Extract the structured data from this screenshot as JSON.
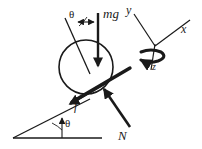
{
  "diagram": {
    "type": "free-body-diagram",
    "stroke_color": "#1a1a1a",
    "background_color": "#ffffff",
    "labels": {
      "weight": "mg",
      "friction": "f",
      "normal": "N",
      "incline_angle": "θ",
      "slope_angle": "θ",
      "axis_x": "x",
      "axis_y": "y",
      "axis_z": "z"
    },
    "elements": {
      "ball": {
        "name": "ball",
        "cx": 86,
        "cy": 67,
        "r": 27
      },
      "weight_arrow": {
        "name": "mg-arrow",
        "x1": 98,
        "y1": 14,
        "x2": 98,
        "y2": 68,
        "direction": "down"
      },
      "tilt_reference_line": {
        "x1": 65,
        "y1": 18,
        "x2": 89,
        "y2": 72
      },
      "angle_arc_top": {
        "cx": 86,
        "cy": 67,
        "label": "θ",
        "label_x": 73,
        "label_y": 16
      },
      "incline_surface_line": {
        "x1": 129,
        "y1": 69,
        "x2": 69,
        "y2": 104
      },
      "friction_arrow": {
        "name": "f-arrow",
        "x1": 104,
        "y1": 84,
        "x2": 69,
        "y2": 104,
        "direction": "down-left"
      },
      "normal_arrow": {
        "name": "N-arrow",
        "x1": 129,
        "y1": 126,
        "x2": 104,
        "y2": 90,
        "direction": "up-left"
      },
      "incline_triangle": {
        "apex_x": 13,
        "apex_y": 138,
        "base_end_x": 101,
        "base_end_y": 138,
        "hyp_end_x": 88,
        "hyp_end_y": 100
      },
      "vertical_marker": {
        "x": 62,
        "y1": 119,
        "y2": 138
      },
      "slope_angle_label": {
        "x": 68,
        "y": 127
      },
      "axes_origin": {
        "x": 155,
        "y": 46
      },
      "axis_y_end": {
        "x": 133,
        "y": 12
      },
      "axis_x_end": {
        "x": 190,
        "y": 19
      },
      "axis_z_end": {
        "x": 152,
        "y": 70
      },
      "spin_ellipse": {
        "cx": 151,
        "cy": 56,
        "rx": 14,
        "ry": 6
      }
    }
  }
}
